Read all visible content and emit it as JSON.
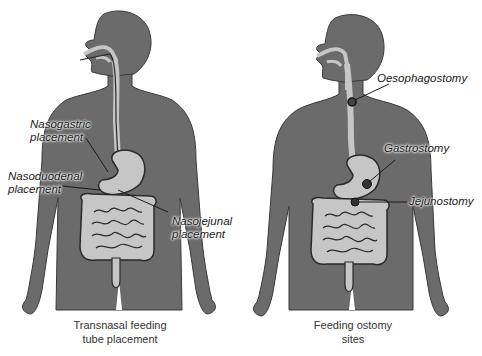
{
  "colors": {
    "body": "#6b6b6b",
    "organ": "#c6c6c6",
    "outline": "#2a2a2a",
    "background": "#ffffff"
  },
  "panels": [
    {
      "id": "transnasal",
      "caption_line1": "Transnasal feeding",
      "caption_line2": "tube placement",
      "labels": [
        {
          "line1": "Nasogastric",
          "line2": "placement"
        },
        {
          "line1": "Nasoduodenal",
          "line2": "placement"
        },
        {
          "line1": "Nasojejunal",
          "line2": "placement"
        }
      ]
    },
    {
      "id": "ostomy",
      "caption_line1": "Feeding ostomy",
      "caption_line2": "sites",
      "labels": [
        {
          "line1": "Oesophagostomy"
        },
        {
          "line1": "Gastrostomy"
        },
        {
          "line1": "Jejunostomy"
        }
      ]
    }
  ]
}
